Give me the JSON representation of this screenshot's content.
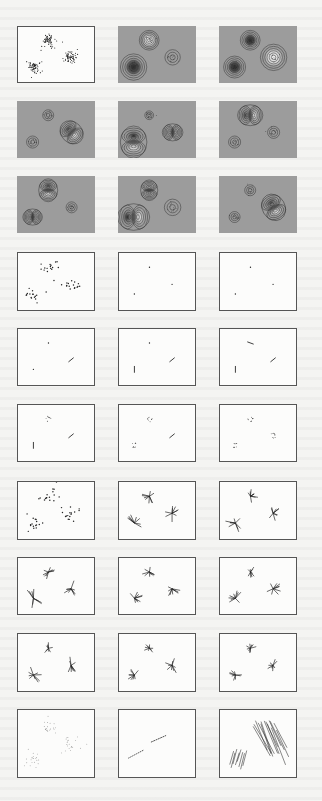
{
  "figure": {
    "colors": {
      "page": "#f4f4f2",
      "frame": "#555555",
      "contour_background": "#9c9c9c",
      "ink": "#222222",
      "contour_line": "#333333",
      "contour_dark_core": "#2a2a2a",
      "contour_light_core": "#f0f0f0"
    },
    "clusters": [
      {
        "name": "top",
        "x": 0.4,
        "y": 0.25
      },
      {
        "name": "bottom-left",
        "x": 0.2,
        "y": 0.72
      },
      {
        "name": "right",
        "x": 0.7,
        "y": 0.55
      }
    ],
    "rows": [
      {
        "kind": "contour",
        "panels": [
          {
            "type": "scatter",
            "density": "dense",
            "framed": true
          },
          {
            "type": "contour",
            "blobs": [
              {
                "cluster": "top",
                "shape": "ring",
                "polarity": "light",
                "size": 0.9
              },
              {
                "cluster": "bottom-left",
                "shape": "ring",
                "polarity": "dark",
                "size": 1.2
              },
              {
                "cluster": "right",
                "shape": "ring",
                "polarity": "none",
                "size": 0.7
              }
            ]
          },
          {
            "type": "contour",
            "blobs": [
              {
                "cluster": "top",
                "shape": "ring",
                "polarity": "dark",
                "size": 0.9
              },
              {
                "cluster": "bottom-left",
                "shape": "ring",
                "polarity": "dark",
                "size": 1.0
              },
              {
                "cluster": "right",
                "shape": "ring",
                "polarity": "light",
                "size": 1.2
              }
            ]
          }
        ]
      },
      {
        "kind": "contour",
        "panels": [
          {
            "type": "contour",
            "blobs": [
              {
                "cluster": "top",
                "shape": "ring",
                "polarity": "none",
                "size": 0.5
              },
              {
                "cluster": "bottom-left",
                "shape": "ring",
                "polarity": "none",
                "size": 0.55
              },
              {
                "cluster": "right",
                "shape": "dipole",
                "polarity": "light",
                "size": 1.1,
                "angle": 45
              }
            ]
          },
          {
            "type": "contour",
            "blobs": [
              {
                "cluster": "top",
                "shape": "scatter",
                "polarity": "none",
                "size": 0.4
              },
              {
                "cluster": "bottom-left",
                "shape": "dipole",
                "polarity": "dark",
                "size": 1.4,
                "angle": 90
              },
              {
                "cluster": "right",
                "shape": "dipole",
                "polarity": "none",
                "size": 0.9,
                "angle": 0
              }
            ]
          },
          {
            "type": "contour",
            "blobs": [
              {
                "cluster": "top",
                "shape": "dipole",
                "polarity": "light",
                "size": 1.1,
                "angle": 0
              },
              {
                "cluster": "bottom-left",
                "shape": "ring",
                "polarity": "none",
                "size": 0.55
              },
              {
                "cluster": "right",
                "shape": "ring",
                "polarity": "none",
                "size": 0.55
              }
            ]
          }
        ]
      },
      {
        "kind": "contour",
        "panels": [
          {
            "type": "contour",
            "blobs": [
              {
                "cluster": "top",
                "shape": "dipole",
                "polarity": "light",
                "size": 1.0,
                "angle": 90
              },
              {
                "cluster": "bottom-left",
                "shape": "dipole",
                "polarity": "none",
                "size": 0.85,
                "angle": 0
              },
              {
                "cluster": "right",
                "shape": "ring",
                "polarity": "none",
                "size": 0.5
              }
            ]
          },
          {
            "type": "contour",
            "blobs": [
              {
                "cluster": "top",
                "shape": "dipole",
                "polarity": "none",
                "size": 0.9,
                "angle": 90
              },
              {
                "cluster": "bottom-left",
                "shape": "dipole",
                "polarity": "dark",
                "size": 1.4,
                "angle": 0
              },
              {
                "cluster": "right",
                "shape": "ring",
                "polarity": "none",
                "size": 0.75
              }
            ]
          },
          {
            "type": "contour",
            "blobs": [
              {
                "cluster": "top",
                "shape": "ring",
                "polarity": "none",
                "size": 0.5
              },
              {
                "cluster": "bottom-left",
                "shape": "ring",
                "polarity": "none",
                "size": 0.5
              },
              {
                "cluster": "right",
                "shape": "dipole",
                "polarity": "light",
                "size": 1.2,
                "angle": 60
              }
            ]
          }
        ]
      },
      {
        "kind": "points",
        "panels": [
          {
            "type": "scatter",
            "density": "sparse",
            "framed": true
          },
          {
            "type": "dots",
            "marks": [
              "top",
              "bottom-left",
              "right"
            ]
          },
          {
            "type": "dots",
            "marks": [
              "top",
              "bottom-left",
              "right"
            ]
          }
        ]
      },
      {
        "kind": "points",
        "panels": [
          {
            "type": "mixed",
            "marks": [
              {
                "cluster": "top",
                "mark": "dot"
              },
              {
                "cluster": "bottom-left",
                "mark": "dot"
              },
              {
                "cluster": "right",
                "mark": "dash",
                "angle": -40
              }
            ]
          },
          {
            "type": "mixed",
            "marks": [
              {
                "cluster": "top",
                "mark": "dot"
              },
              {
                "cluster": "bottom-left",
                "mark": "dash",
                "angle": 90
              },
              {
                "cluster": "right",
                "mark": "dash",
                "angle": -40
              }
            ]
          },
          {
            "type": "mixed",
            "marks": [
              {
                "cluster": "top",
                "mark": "dash",
                "angle": 20
              },
              {
                "cluster": "bottom-left",
                "mark": "dash",
                "angle": 90
              },
              {
                "cluster": "right",
                "mark": "dash",
                "angle": -40
              }
            ]
          }
        ]
      },
      {
        "kind": "points",
        "panels": [
          {
            "type": "mixed",
            "marks": [
              {
                "cluster": "top",
                "mark": "tiny-cluster"
              },
              {
                "cluster": "bottom-left",
                "mark": "dash",
                "angle": 90
              },
              {
                "cluster": "right",
                "mark": "dash",
                "angle": -40
              }
            ]
          },
          {
            "type": "mixed",
            "marks": [
              {
                "cluster": "top",
                "mark": "tiny-cluster"
              },
              {
                "cluster": "bottom-left",
                "mark": "tiny-cluster"
              },
              {
                "cluster": "right",
                "mark": "dash",
                "angle": -40
              }
            ]
          },
          {
            "type": "mixed",
            "marks": [
              {
                "cluster": "top",
                "mark": "tiny-cluster"
              },
              {
                "cluster": "bottom-left",
                "mark": "tiny-cluster"
              },
              {
                "cluster": "right",
                "mark": "tiny-cluster"
              }
            ]
          }
        ]
      },
      {
        "kind": "stars",
        "panels": [
          {
            "type": "scatter",
            "density": "sparse",
            "framed": true
          },
          {
            "type": "stars",
            "spread": [
              0.9,
              1.2,
              1.0
            ]
          },
          {
            "type": "stars",
            "spread": [
              0.9,
              1.2,
              1.0
            ]
          }
        ]
      },
      {
        "kind": "stars",
        "panels": [
          {
            "type": "stars",
            "spread": [
              0.9,
              1.2,
              1.0
            ]
          },
          {
            "type": "stars",
            "spread": [
              0.9,
              1.0,
              1.0
            ]
          },
          {
            "type": "stars",
            "spread": [
              0.7,
              1.0,
              1.0
            ]
          }
        ]
      },
      {
        "kind": "stars",
        "panels": [
          {
            "type": "stars",
            "spread": [
              0.7,
              1.1,
              1.0
            ]
          },
          {
            "type": "stars",
            "spread": [
              0.7,
              0.9,
              1.0
            ]
          },
          {
            "type": "stars",
            "spread": [
              0.7,
              0.9,
              0.8
            ]
          }
        ]
      },
      {
        "kind": "final",
        "panels": [
          {
            "type": "scatter",
            "density": "faint",
            "framed": true
          },
          {
            "type": "lines",
            "description": "points collapsed onto two short oblique line segments"
          },
          {
            "type": "hatch",
            "description": "two bundles of parallel oblique strokes"
          }
        ]
      }
    ]
  }
}
